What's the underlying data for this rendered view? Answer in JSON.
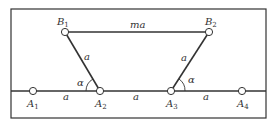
{
  "diagram": {
    "type": "linkage-geometry",
    "frame": {
      "x": 11,
      "y": 9,
      "width": 255,
      "height": 109
    },
    "colors": {
      "line": "#333333",
      "frame": "#333333",
      "node_fill": "#ffffff",
      "text": "#333333"
    },
    "points": {
      "B1": {
        "x": 65,
        "y": 32,
        "label": "B",
        "sub": "1"
      },
      "B2": {
        "x": 209,
        "y": 32,
        "label": "B",
        "sub": "2"
      },
      "A1": {
        "x": 33,
        "y": 91,
        "label": "A",
        "sub": "1"
      },
      "A2": {
        "x": 100,
        "y": 91,
        "label": "A",
        "sub": "2"
      },
      "A3": {
        "x": 171,
        "y": 91,
        "label": "A",
        "sub": "3"
      },
      "A4": {
        "x": 242,
        "y": 91,
        "label": "A",
        "sub": "4"
      }
    },
    "segment_labels": {
      "B1B2": "ma",
      "B1A2": "a",
      "A3B2": "a",
      "A1A2": "a",
      "A2A3": "a",
      "A3A4": "a"
    },
    "angle_labels": {
      "at_A2": "α",
      "at_A3": "α"
    }
  }
}
